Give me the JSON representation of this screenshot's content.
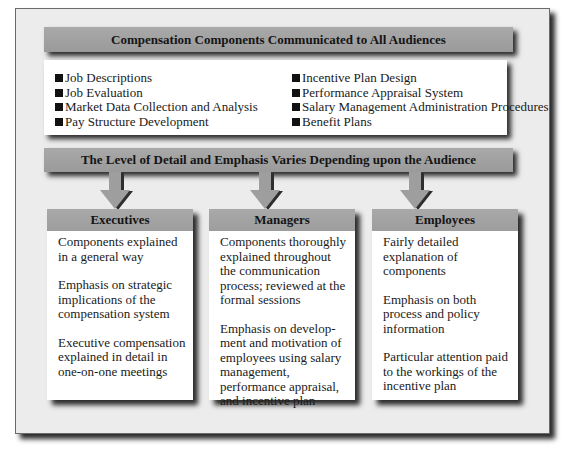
{
  "diagram": {
    "top_banner": "Compensation Components Communicated to All Audiences",
    "components_left": [
      "Job Descriptions",
      "Job Evaluation",
      "Market Data Collection and Analysis",
      "Pay Structure Development"
    ],
    "components_right": [
      "Incentive Plan Design",
      "Performance Appraisal System",
      "Salary Management Administration Procedures",
      "Benefit Plans"
    ],
    "middle_banner": "The Level of Detail and Emphasis Varies Depending upon the Audience",
    "audiences": [
      {
        "title": "Executives",
        "points": [
          "Components explained in a general way",
          "Emphasis on strategic implications of the compensation system",
          "Executive compensation explained in detail in one-on-one meetings"
        ]
      },
      {
        "title": "Managers",
        "points": [
          "Components thoroughly explained throughout the communication process; reviewed at the formal sessions",
          "Emphasis on develop-ment and motivation of employees using salary management, performance appraisal, and incentive plan"
        ]
      },
      {
        "title": "Employees",
        "points": [
          "Fairly detailed explanation of components",
          "Emphasis on both process and policy information",
          "Particular attention paid to the workings of the incentive plan"
        ]
      }
    ]
  },
  "colors": {
    "banner": "#a3a3a3",
    "frame": "#ececec",
    "box": "#ffffff",
    "shadow": "#2b2b2b",
    "arrow": "#9e9e9e"
  }
}
